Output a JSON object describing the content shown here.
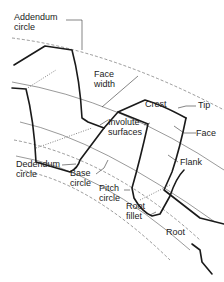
{
  "diagram": {
    "labels": {
      "addendum_circle": [
        "Addendum",
        "circle"
      ],
      "face_width": [
        "Face",
        "width"
      ],
      "crest": "Crest",
      "tip": "Tip",
      "involute_surfaces": [
        "Involute",
        "surfaces"
      ],
      "face": "Face",
      "flank": "Flank",
      "dedendum_circle": [
        "Dedendum",
        "circle"
      ],
      "base_circle": [
        "Base",
        "circle"
      ],
      "pitch_circle": [
        "Pitch",
        "circle"
      ],
      "root_fillet": [
        "Root",
        "fillet"
      ],
      "root": "Root"
    },
    "colors": {
      "background": "#ffffff",
      "ink": "#1a1a1a"
    }
  }
}
